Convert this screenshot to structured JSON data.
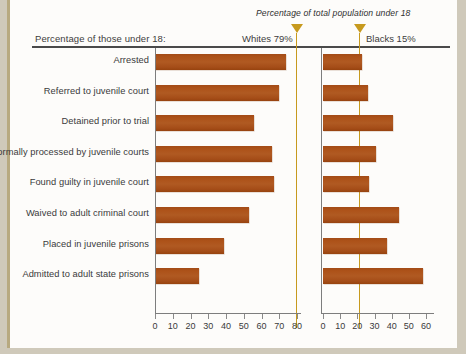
{
  "header": {
    "left_label": "Percentage of those under 18:",
    "population_note": "Percentage of total population under 18",
    "whites_marker": "Whites 79%",
    "blacks_marker": "Blacks 15%"
  },
  "colors": {
    "bar": "#a94f18",
    "marker": "#c79a1e",
    "axis": "#7d7d7d",
    "rule": "#4a4a4a",
    "background": "#fdfcfa",
    "frame": "#cfc9ba"
  },
  "chart_data": [
    {
      "type": "bar",
      "title": "Whites",
      "orientation": "horizontal",
      "xlabel": "",
      "ylabel": "",
      "xlim": [
        0,
        80
      ],
      "ticks": [
        0,
        10,
        20,
        30,
        40,
        50,
        60,
        70,
        80
      ],
      "grid": false,
      "legend": "none",
      "reference_line": {
        "label": "Whites 79%",
        "value": 79
      },
      "categories": [
        "Arrested",
        "Referred to juvenile court",
        "Detained prior to trial",
        "Formally processed by juvenile courts",
        "Found guilty in juvenile court",
        "Waived to adult criminal court",
        "Placed in juvenile prisons",
        "Admitted to adult state prisons"
      ],
      "values": [
        74,
        70,
        56,
        66,
        67,
        53,
        39,
        25
      ]
    },
    {
      "type": "bar",
      "title": "Blacks",
      "orientation": "horizontal",
      "xlabel": "",
      "ylabel": "",
      "xlim": [
        0,
        60
      ],
      "ticks": [
        0,
        10,
        20,
        30,
        40,
        50,
        60
      ],
      "grid": false,
      "legend": "none",
      "reference_line": {
        "label": "Blacks 15%",
        "value": 15
      },
      "categories": [
        "Arrested",
        "Referred to juvenile court",
        "Detained prior to trial",
        "Formally processed by juvenile courts",
        "Found guilty in juvenile court",
        "Waived to adult criminal court",
        "Placed in juvenile prisons",
        "Admitted to adult state prisons"
      ],
      "values": [
        23,
        26,
        41,
        31,
        27,
        44,
        37,
        58
      ]
    }
  ]
}
